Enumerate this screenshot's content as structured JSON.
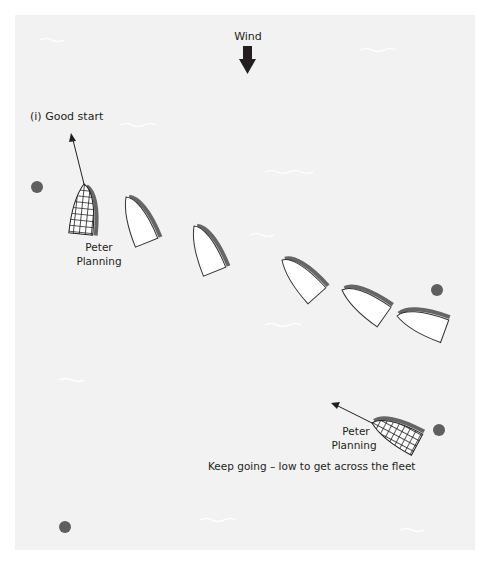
{
  "diagram": {
    "wind_label": "Wind",
    "title_label": "(i) Good start",
    "caption": "Keep going – low to get across the fleet",
    "boat_label_line1": "Peter",
    "boat_label_line2": "Planning",
    "colors": {
      "background": "#f2f2f2",
      "hull_fill": "#ffffff",
      "hull_outline": "#333333",
      "gunwale_shade": "#666666",
      "mark": "#5f5f5f",
      "arrow": "#231f20",
      "hatched_fill": "#ffffff",
      "hatched_grid": "#231f20"
    },
    "icons": {
      "wind_arrow": "down-arrow-icon",
      "mark": "buoy-mark-icon",
      "boat": "dinghy-icon"
    }
  }
}
